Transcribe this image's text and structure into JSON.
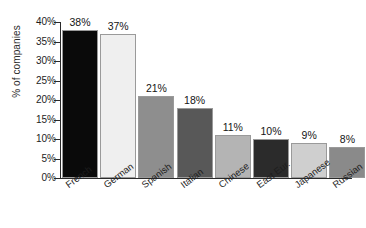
{
  "chart_data": {
    "type": "bar",
    "title": "",
    "subtitle": "",
    "xlabel": "",
    "ylabel": "% of companies",
    "categories": [
      "French",
      "German",
      "Spanish",
      "Italian",
      "Chinese",
      "East Eur.",
      "Japanese",
      "Russian"
    ],
    "values": [
      38,
      37,
      21,
      18,
      11,
      10,
      9,
      8
    ],
    "value_labels": [
      "38%",
      "37%",
      "21%",
      "18%",
      "11%",
      "10%",
      "9%",
      "8%"
    ],
    "ylim": [
      0,
      40
    ],
    "ytick_values": [
      0,
      5,
      10,
      15,
      20,
      25,
      30,
      35,
      40
    ],
    "ytick_labels": [
      "0%",
      "5%",
      "10%",
      "15%",
      "20%",
      "25%",
      "30%",
      "35%",
      "40%"
    ],
    "grid": false,
    "legend": "none",
    "bar_colors": [
      "#0a0a0a",
      "#efefef",
      "#8e8e8e",
      "#585858",
      "#b4b4b4",
      "#2b2b2b",
      "#cfcfcf",
      "#8a8a8a"
    ],
    "bar_border_color": "#9a9a9a",
    "background_color": "#ffffff",
    "axis_color": "#2a2a2a"
  }
}
